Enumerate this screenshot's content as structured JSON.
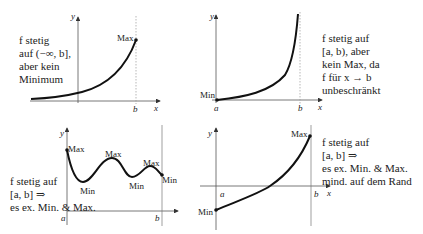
{
  "panels": [
    {
      "id": "panel-1",
      "description": [
        "f stetig",
        "auf (−∞, b],",
        "aber kein",
        "Minimum"
      ],
      "labels": {
        "y": "y",
        "x": "x",
        "b": "b",
        "max": "Max"
      }
    },
    {
      "id": "panel-2",
      "description": [
        "f stetig auf",
        "[a, b), aber",
        "kein Max, da",
        "f für x → b",
        "unbeschränkt"
      ],
      "labels": {
        "y": "y",
        "x": "x",
        "a": "a",
        "b": "b",
        "min": "Min"
      }
    },
    {
      "id": "panel-3",
      "description": [
        "f stetig auf",
        "[a, b] ⇒",
        "es ex. Min. & Max."
      ],
      "labels": {
        "y": "y",
        "a": "a",
        "b": "b",
        "max1": "Max",
        "max2": "Max",
        "max3": "Max",
        "min1": "Min",
        "min2": "Min",
        "min3": "Min"
      }
    },
    {
      "id": "panel-4",
      "description": [
        "f stetig auf",
        "[a, b] ⇒",
        "es ex. Min. & Max.",
        "mind. auf dem Rand"
      ],
      "labels": {
        "y": "y",
        "x": "x",
        "a": "a",
        "b": "b",
        "max": "Max",
        "min": "Min"
      }
    }
  ],
  "colors": {
    "curve": "#111111",
    "axis": "#444444",
    "guide": "#999999"
  }
}
